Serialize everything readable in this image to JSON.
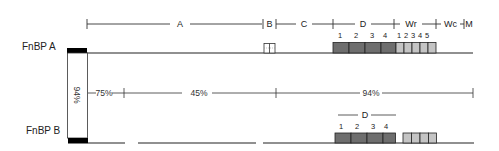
{
  "proteins": [
    {
      "name": "FnBP A"
    },
    {
      "name": "FnBP B"
    }
  ],
  "regions": [
    "A",
    "B",
    "C",
    "D",
    "Wr",
    "Wc",
    "M"
  ],
  "fnbpa_d_repeats": [
    "1",
    "2",
    "3",
    "4"
  ],
  "fnbpa_wr_repeats": [
    "1",
    "2",
    "3",
    "4",
    "5"
  ],
  "fnbpb_d_label": "D",
  "fnbpb_d_repeats": [
    "1",
    "2",
    "3",
    "4"
  ],
  "identity": {
    "signal": "94%",
    "segment1": "75%",
    "segment2": "45%",
    "segment3": "94%"
  },
  "colors": {
    "line": "#222222",
    "d_repeat": "#6e6e6e",
    "wr_repeat": "#c4c4c4",
    "signal": "#000000"
  }
}
